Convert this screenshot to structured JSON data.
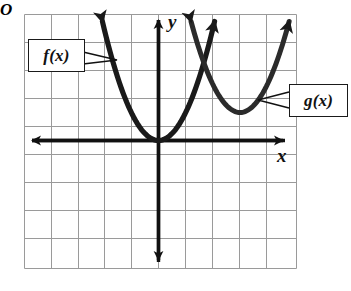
{
  "figure": {
    "title": "",
    "background": "#ffffff"
  },
  "labels": {
    "f_label": "f(x)",
    "g_label": "g(x)",
    "x_axis_label": "x",
    "y_axis_label": "y",
    "origin_label": "O"
  },
  "colors": {
    "grid": "#9a9a9a",
    "axis": "#111111",
    "curve": "#1a1a1a",
    "box_border": "#1a1a1a",
    "background": "#ffffff"
  },
  "chart_data": {
    "type": "line",
    "title": "",
    "xlabel": "x",
    "ylabel": "y",
    "grid": true,
    "legend": "callout-boxes",
    "xlim": [
      -5,
      5
    ],
    "ylim": [
      -4.5,
      4.5
    ],
    "x_tick_step": 1,
    "y_tick_step": 1,
    "tick_labels_shown": false,
    "origin_marker": "O",
    "annotations": [
      {
        "text": "f(x)",
        "box": true,
        "box_x": -4.25,
        "box_y": 3.1,
        "leader_to": [
          [
            -2.05,
            2.9
          ],
          [
            -1.75,
            2.3
          ]
        ]
      },
      {
        "text": "g(x)",
        "box": true,
        "box_x": 5.35,
        "box_y": 1.5,
        "leader_to": [
          [
            3.1,
            1.95
          ],
          [
            3.25,
            1.35
          ]
        ]
      }
    ],
    "series": [
      {
        "name": "f(x)",
        "equation": "y = x^2",
        "vertex": [
          0,
          0
        ],
        "a": 1,
        "h": 0,
        "k": 0,
        "color": "#1a1a1a",
        "arrows": "both-ends-up",
        "points": [
          {
            "x": -2.05,
            "y": 4.2
          },
          {
            "x": -1.8,
            "y": 3.24
          },
          {
            "x": -1.5,
            "y": 2.25
          },
          {
            "x": -1.0,
            "y": 1.0
          },
          {
            "x": -0.5,
            "y": 0.25
          },
          {
            "x": 0,
            "y": 0
          },
          {
            "x": 0.5,
            "y": 0.25
          },
          {
            "x": 1.0,
            "y": 1.0
          },
          {
            "x": 1.5,
            "y": 2.25
          },
          {
            "x": 1.8,
            "y": 3.24
          },
          {
            "x": 2.05,
            "y": 4.2
          }
        ]
      },
      {
        "name": "g(x)",
        "equation": "y = (x - 3)^2 + 1",
        "vertex": [
          3,
          1
        ],
        "a": 1,
        "h": 3,
        "k": 1,
        "color": "#2b2b2b",
        "arrows": "both-ends-up",
        "points": [
          {
            "x": 1.2,
            "y": 4.24
          },
          {
            "x": 1.5,
            "y": 3.25
          },
          {
            "x": 2.0,
            "y": 2.0
          },
          {
            "x": 2.5,
            "y": 1.25
          },
          {
            "x": 3.0,
            "y": 1.0
          },
          {
            "x": 3.5,
            "y": 1.25
          },
          {
            "x": 4.0,
            "y": 2.0
          },
          {
            "x": 4.5,
            "y": 3.25
          },
          {
            "x": 4.8,
            "y": 4.24
          }
        ]
      }
    ],
    "intersection_approx": [
      1.7,
      2.9
    ]
  }
}
